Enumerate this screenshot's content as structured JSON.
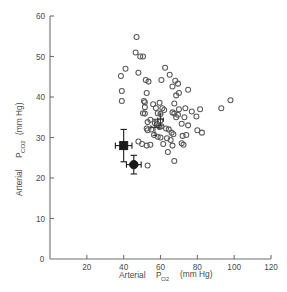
{
  "chart_data": {
    "type": "scatter",
    "title": "",
    "xlabel": "Arterial  P O2   (mm Hg)",
    "xlabel_main": "Arterial",
    "xlabel_sym": "P",
    "xlabel_sub": "O2",
    "xlabel_units": "(mm Hg)",
    "ylabel_main": "Arterial",
    "ylabel_sym": "P",
    "ylabel_sub": "CO2",
    "ylabel_units": "(mm Hg)",
    "xlim": [
      0,
      120
    ],
    "ylim": [
      0,
      60
    ],
    "xticks": [
      0,
      20,
      40,
      60,
      80,
      100,
      120
    ],
    "yticks": [
      0,
      10,
      20,
      30,
      40,
      50,
      60
    ],
    "xtick_labels": [
      "0",
      "20",
      "40",
      "60",
      "80",
      "100",
      "120"
    ],
    "ytick_labels": [
      "0",
      "10",
      "20",
      "30",
      "40",
      "50",
      "60"
    ],
    "grid": false,
    "legend": "none",
    "marker_open": "open-circle",
    "marker_mean_1": "filled-square",
    "marker_mean_2": "filled-circle",
    "series": [
      {
        "name": "individual subjects",
        "marker": "open-circle",
        "points": [
          [
            47.0,
            54.8
          ],
          [
            46.5,
            51.0
          ],
          [
            49.0,
            50.0
          ],
          [
            50.5,
            50.0
          ],
          [
            41.0,
            47.0
          ],
          [
            38.5,
            45.2
          ],
          [
            62.5,
            47.2
          ],
          [
            48.0,
            46.0
          ],
          [
            65.0,
            45.5
          ],
          [
            52.0,
            44.2
          ],
          [
            53.5,
            43.8
          ],
          [
            60.5,
            44.2
          ],
          [
            68.0,
            44.0
          ],
          [
            69.5,
            43.3
          ],
          [
            66.5,
            42.6
          ],
          [
            75.0,
            41.8
          ],
          [
            39.0,
            41.5
          ],
          [
            52.5,
            41.0
          ],
          [
            70.0,
            41.0
          ],
          [
            68.5,
            40.4
          ],
          [
            98.0,
            39.2
          ],
          [
            39.0,
            39.0
          ],
          [
            51.0,
            39.0
          ],
          [
            51.5,
            38.7
          ],
          [
            59.5,
            38.6
          ],
          [
            56.0,
            38.2
          ],
          [
            67.5,
            38.4
          ],
          [
            93.0,
            37.2
          ],
          [
            51.5,
            37.5
          ],
          [
            57.5,
            37.3
          ],
          [
            61.0,
            37.2
          ],
          [
            62.0,
            36.8
          ],
          [
            70.0,
            37.0
          ],
          [
            73.5,
            37.2
          ],
          [
            81.5,
            37.0
          ],
          [
            77.0,
            36.4
          ],
          [
            50.5,
            36.0
          ],
          [
            51.5,
            35.9
          ],
          [
            58.5,
            36.0
          ],
          [
            60.0,
            35.8
          ],
          [
            66.5,
            36.2
          ],
          [
            67.5,
            35.9
          ],
          [
            69.5,
            35.6
          ],
          [
            68.5,
            35.0
          ],
          [
            73.0,
            35.0
          ],
          [
            79.5,
            35.2
          ],
          [
            54.5,
            34.4
          ],
          [
            60.0,
            34.2
          ],
          [
            53.0,
            33.8
          ],
          [
            57.0,
            33.5
          ],
          [
            58.0,
            33.2
          ],
          [
            59.0,
            32.9
          ],
          [
            59.5,
            32.6
          ],
          [
            60.5,
            32.8
          ],
          [
            63.0,
            32.2
          ],
          [
            64.5,
            32.0
          ],
          [
            71.5,
            33.4
          ],
          [
            75.0,
            33.0
          ],
          [
            82.5,
            31.2
          ],
          [
            80.0,
            31.8
          ],
          [
            52.5,
            32.2
          ],
          [
            53.0,
            31.8
          ],
          [
            55.0,
            32.0
          ],
          [
            66.0,
            31.2
          ],
          [
            67.0,
            30.8
          ],
          [
            72.0,
            30.4
          ],
          [
            74.0,
            30.6
          ],
          [
            56.5,
            30.6
          ],
          [
            58.5,
            30.2
          ],
          [
            60.0,
            30.0
          ],
          [
            63.5,
            29.8
          ],
          [
            65.5,
            29.4
          ],
          [
            48.0,
            29.0
          ],
          [
            50.0,
            28.4
          ],
          [
            52.5,
            28.0
          ],
          [
            54.5,
            28.2
          ],
          [
            61.5,
            28.4
          ],
          [
            66.5,
            28.0
          ],
          [
            71.5,
            28.6
          ],
          [
            72.5,
            28.2
          ],
          [
            64.0,
            26.4
          ],
          [
            67.5,
            24.2
          ],
          [
            53.0,
            23.1
          ]
        ]
      }
    ],
    "mean_points": [
      {
        "label": "mean-square",
        "marker": "filled-square",
        "x": 40.0,
        "y": 28.0,
        "x_err": 4.5,
        "y_err": 4.0
      },
      {
        "label": "mean-circle",
        "marker": "filled-circle",
        "x": 45.5,
        "y": 23.3,
        "x_err": 4.0,
        "y_err": 2.3
      }
    ],
    "inner_markers": [
      {
        "label": "cluster-cross-1",
        "marker": "cross",
        "x": 57.0,
        "y": 32.5,
        "x_err": 2.2,
        "y_err": 2.0
      },
      {
        "label": "cluster-cross-2",
        "marker": "cross",
        "x": 60.0,
        "y": 34.4,
        "x_err": 1.6,
        "y_err": 1.4
      }
    ],
    "colors": {
      "axis": "#6f6f6f",
      "open_marker": "#5a5a5a",
      "filled_marker": "#1a1a1a",
      "background": "#ffffff"
    }
  }
}
